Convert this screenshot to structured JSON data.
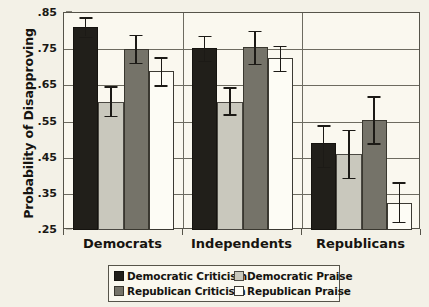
{
  "chart_data": {
    "type": "bar",
    "title": "",
    "xlabel": "",
    "ylabel": "Probability of Disapproving",
    "categories": [
      "Democrats",
      "Independents",
      "Republicans"
    ],
    "ylim": [
      0.25,
      0.85
    ],
    "ytick_labels": [
      ".85",
      ".75",
      ".65",
      ".55",
      ".45",
      ".35",
      ".25"
    ],
    "ytick_values": [
      0.85,
      0.75,
      0.65,
      0.55,
      0.45,
      0.35,
      0.25
    ],
    "grid": true,
    "legend_position": "bottom",
    "series": [
      {
        "name": "Democratic Criticism",
        "color": "#211f1a",
        "values": [
          0.81,
          0.752,
          0.49
        ],
        "err_low": [
          0.785,
          0.718,
          0.425
        ],
        "err_high": [
          0.838,
          0.787,
          0.54
        ]
      },
      {
        "name": "Democratic Praise",
        "color": "#c9c8bd",
        "values": [
          0.605,
          0.605,
          0.46
        ],
        "err_low": [
          0.565,
          0.57,
          0.395
        ],
        "err_high": [
          0.647,
          0.645,
          0.527
        ]
      },
      {
        "name": "Republican Criticism",
        "color": "#757369",
        "values": [
          0.75,
          0.755,
          0.555
        ],
        "err_low": [
          0.713,
          0.71,
          0.49
        ],
        "err_high": [
          0.79,
          0.8,
          0.62
        ]
      },
      {
        "name": "Republican Praise",
        "color": "#fdfcf5",
        "values": [
          0.69,
          0.725,
          0.325
        ],
        "err_low": [
          0.65,
          0.69,
          0.272
        ],
        "err_high": [
          0.728,
          0.76,
          0.382
        ]
      }
    ]
  },
  "legend": {
    "items": [
      {
        "label": "Democratic Criticism",
        "swatch": "c-dem-crit"
      },
      {
        "label": "Democratic Praise",
        "swatch": "c-dem-praise"
      },
      {
        "label": "Republican Criticism",
        "swatch": "c-rep-crit"
      },
      {
        "label": "Republican Praise",
        "swatch": "c-rep-praise"
      }
    ]
  }
}
